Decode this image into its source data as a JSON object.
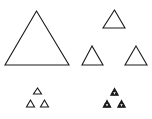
{
  "diagram": {
    "title": "",
    "stroke_color": "#1a1a1a",
    "background": "#ffffff",
    "stages": [
      {
        "name": "stage-0",
        "triangles": [
          {
            "apex": [
              36.5,
              11
            ],
            "left": [
              5,
              65
            ],
            "right": [
              69,
              65
            ],
            "filled": false
          }
        ]
      },
      {
        "name": "stage-1",
        "triangles": [
          {
            "apex": [
              114.5,
              10
            ],
            "left": [
              103,
              28
            ],
            "right": [
              125,
              28
            ],
            "filled": false
          },
          {
            "apex": [
              92,
              46
            ],
            "left": [
              82,
              65
            ],
            "right": [
              103,
              65
            ],
            "filled": false
          },
          {
            "apex": [
              136,
              46
            ],
            "left": [
              125,
              65
            ],
            "right": [
              147,
              65
            ],
            "filled": false
          }
        ]
      },
      {
        "name": "stage-2",
        "triangles": [
          {
            "apex": [
              37.5,
              88
            ],
            "left": [
              33.5,
              94
            ],
            "right": [
              41.5,
              94
            ],
            "filled": false
          },
          {
            "apex": [
              30.5,
              100
            ],
            "left": [
              26.5,
              107
            ],
            "right": [
              34.5,
              107
            ],
            "filled": false
          },
          {
            "apex": [
              44.5,
              100
            ],
            "left": [
              40.5,
              107
            ],
            "right": [
              48.5,
              107
            ],
            "filled": false
          }
        ]
      },
      {
        "name": "stage-3",
        "clusters": [
          {
            "center": [
              114.5,
              92
            ]
          },
          {
            "center": [
              107,
              104
            ]
          },
          {
            "center": [
              121.5,
              104
            ]
          }
        ],
        "cluster_size": 8
      }
    ]
  }
}
